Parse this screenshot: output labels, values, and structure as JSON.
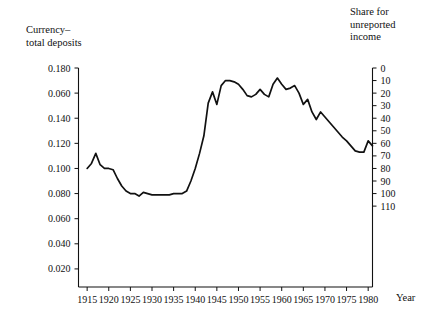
{
  "figure": {
    "left_axis_title": "Currency–\ntotal deposits",
    "right_axis_title": "Share for\nunreported\nincome",
    "x_axis_title": "Year"
  },
  "chart_data": {
    "type": "line",
    "title": "",
    "subtitle": "",
    "xlabel": "Year",
    "ylabel": "Currency–total deposits",
    "y2label": "Share for unreported income",
    "grid": false,
    "legend": "none",
    "xlim": [
      1913,
      1981
    ],
    "ylim": [
      0.0,
      0.19
    ],
    "y2lim": [
      0,
      110
    ],
    "x_tick_labels": [
      "1915",
      "1920",
      "1925",
      "1930",
      "1935",
      "1940",
      "1945",
      "1950",
      "1955",
      "1960",
      "1965",
      "1970",
      "1975",
      "1980"
    ],
    "x_ticks": [
      1915,
      1920,
      1925,
      1930,
      1935,
      1940,
      1945,
      1950,
      1955,
      1960,
      1965,
      1970,
      1975,
      1980
    ],
    "y_tick_labels": [
      "0.180",
      "0.060",
      "0.140",
      "0.120",
      "0.100",
      "0.080",
      "0.060",
      "0.040",
      "0.020"
    ],
    "y_ticks": [
      0.18,
      0.16,
      0.14,
      0.12,
      0.1,
      0.08,
      0.06,
      0.04,
      0.02
    ],
    "y2_tick_labels": [
      "110",
      "100",
      "90",
      "80",
      "70",
      "60",
      "50",
      "40",
      "30",
      "20",
      "10",
      "0"
    ],
    "y2_ticks": [
      110,
      100,
      90,
      80,
      70,
      60,
      50,
      40,
      30,
      20,
      10,
      0
    ],
    "series": [
      {
        "name": "Currency–total deposits",
        "x": [
          1915,
          1916,
          1917,
          1918,
          1919,
          1920,
          1921,
          1922,
          1923,
          1924,
          1925,
          1926,
          1927,
          1928,
          1929,
          1930,
          1931,
          1932,
          1933,
          1934,
          1935,
          1936,
          1937,
          1938,
          1939,
          1940,
          1941,
          1942,
          1943,
          1944,
          1945,
          1946,
          1947,
          1948,
          1949,
          1950,
          1951,
          1952,
          1953,
          1954,
          1955,
          1956,
          1957,
          1958,
          1959,
          1960,
          1961,
          1962,
          1963,
          1964,
          1965,
          1966,
          1967,
          1968,
          1969,
          1970,
          1971,
          1972,
          1973,
          1974,
          1975,
          1976,
          1977,
          1978,
          1979
        ],
        "values": [
          0.1,
          0.104,
          0.112,
          0.103,
          0.1,
          0.1,
          0.099,
          0.092,
          0.086,
          0.082,
          0.08,
          0.08,
          0.078,
          0.081,
          0.08,
          0.079,
          0.079,
          0.079,
          0.079,
          0.079,
          0.08,
          0.08,
          0.08,
          0.082,
          0.09,
          0.1,
          0.112,
          0.126,
          0.152,
          0.161,
          0.151,
          0.166,
          0.17,
          0.17,
          0.169,
          0.167,
          0.163,
          0.158,
          0.157,
          0.159,
          0.163,
          0.159,
          0.157,
          0.167,
          0.172,
          0.167,
          0.163,
          0.164,
          0.166,
          0.16,
          0.151,
          0.155,
          0.145,
          0.139,
          0.145,
          0.141,
          0.137,
          0.133,
          0.129,
          0.125,
          0.122,
          0.118,
          0.114,
          0.113,
          0.113
        ],
        "values_tail_x": [
          1980,
          1981
        ],
        "values_tail": [
          0.122,
          0.118
        ]
      }
    ]
  }
}
